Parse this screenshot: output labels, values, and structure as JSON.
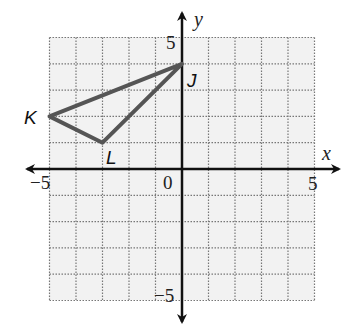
{
  "graph": {
    "axes": {
      "x_label": "x",
      "y_label": "y",
      "x_min": -5,
      "x_max": 5,
      "y_min": -5,
      "y_max": 5
    },
    "tick_labels": {
      "x_neg": "−5",
      "x_pos": "5",
      "origin": "0",
      "y_pos": "5",
      "y_neg": "−5"
    },
    "triangle": {
      "vertices": [
        {
          "name": "J",
          "x": 0,
          "y": 4
        },
        {
          "name": "K",
          "x": -5,
          "y": 2
        },
        {
          "name": "L",
          "x": -3,
          "y": 1
        }
      ],
      "stroke_color": "#555555"
    },
    "grid_color": "#888888",
    "grid_fill": "#f2f2f2"
  }
}
